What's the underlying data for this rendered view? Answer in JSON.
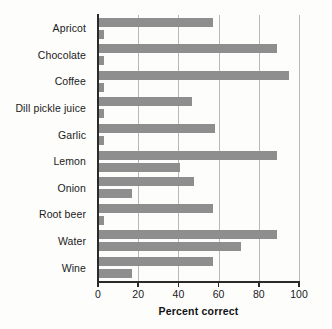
{
  "chart_data": {
    "type": "bar",
    "orientation": "horizontal",
    "title": "",
    "xlabel": "Percent correct",
    "ylabel": "",
    "xlim": [
      0,
      100
    ],
    "xticks": [
      0,
      20,
      40,
      60,
      80,
      100
    ],
    "xtick_labels": [
      "0",
      "20",
      "40",
      "60",
      "80",
      "100"
    ],
    "grid": "vertical",
    "legend": "none",
    "bar_color": "#8e8e8e",
    "categories": [
      "Apricot",
      "Chocolate",
      "Coffee",
      "Dill pickle juice",
      "Garlic",
      "Lemon",
      "Onion",
      "Root beer",
      "Water",
      "Wine"
    ],
    "series": [
      {
        "name": "upper",
        "values": [
          57,
          89,
          95,
          47,
          58,
          89,
          48,
          57,
          89,
          57
        ]
      },
      {
        "name": "lower",
        "values": [
          3,
          3,
          3,
          3,
          3,
          41,
          17,
          3,
          71,
          17
        ]
      }
    ]
  }
}
